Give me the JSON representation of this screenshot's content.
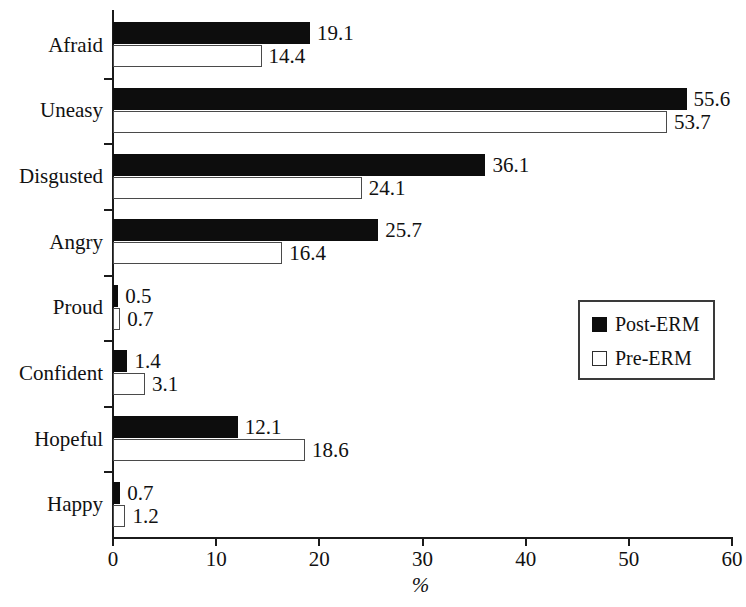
{
  "chart_data": {
    "type": "bar",
    "orientation": "horizontal",
    "title": "",
    "subtitle": "",
    "xlabel": "%",
    "ylabel": "",
    "xlim": [
      0,
      60
    ],
    "xticks": [
      0,
      10,
      20,
      30,
      40,
      50,
      60
    ],
    "xtick_labels": [
      "0",
      "10",
      "20",
      "30",
      "40",
      "50",
      "60"
    ],
    "grid": false,
    "legend_position": "middle-right",
    "categories": [
      "Afraid",
      "Uneasy",
      "Disgusted",
      "Angry",
      "Proud",
      "Confident",
      "Hopeful",
      "Happy"
    ],
    "series": [
      {
        "name": "Post-ERM",
        "color": "#0d0d0d",
        "fill": "solid-black",
        "values": [
          19.1,
          55.6,
          36.1,
          25.7,
          0.5,
          1.4,
          12.1,
          0.7
        ],
        "value_labels": [
          "19.1",
          "55.6",
          "36.1",
          "25.7",
          "0.5",
          "1.4",
          "12.1",
          "0.7"
        ]
      },
      {
        "name": "Pre-ERM",
        "color": "#ffffff",
        "fill": "white-outlined",
        "values": [
          14.4,
          53.7,
          24.1,
          16.4,
          0.7,
          3.1,
          18.6,
          1.2
        ],
        "value_labels": [
          "14.4",
          "53.7",
          "24.1",
          "16.4",
          "0.7",
          "3.1",
          "18.6",
          "1.2"
        ]
      }
    ]
  },
  "legend": {
    "entries": [
      {
        "label": "Post-ERM",
        "swatch": "filled-square-icon"
      },
      {
        "label": "Pre-ERM",
        "swatch": "outlined-square-icon"
      }
    ]
  }
}
